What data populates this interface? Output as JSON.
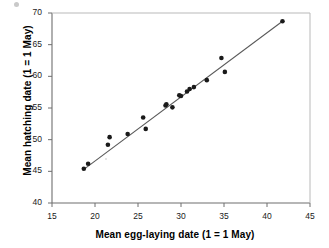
{
  "chart_data": {
    "type": "scatter",
    "title": "",
    "xlabel": "Mean egg-laying date (1 = 1 May)",
    "ylabel": "Mean hatching date (1 = 1 May)",
    "xlim": [
      15,
      45
    ],
    "ylim": [
      40,
      70
    ],
    "xticks": [
      15,
      20,
      25,
      30,
      35,
      40,
      45
    ],
    "yticks": [
      40,
      45,
      50,
      55,
      60,
      65,
      70
    ],
    "xtick_labels": [
      "15",
      "20",
      "25",
      "30",
      "35",
      "40",
      "45"
    ],
    "ytick_labels": [
      "40",
      "45",
      "50",
      "55",
      "60",
      "65",
      "70"
    ],
    "grid": false,
    "legend": null,
    "marker": {
      "shape": "circle",
      "color": "#1a1a1a",
      "size": 4.6
    },
    "series": [
      {
        "name": "Mean hatching date vs mean egg-laying date",
        "points": [
          {
            "x": 18.7,
            "y": 45.4
          },
          {
            "x": 19.2,
            "y": 46.2
          },
          {
            "x": 21.5,
            "y": 49.2
          },
          {
            "x": 21.7,
            "y": 50.4
          },
          {
            "x": 23.8,
            "y": 50.9
          },
          {
            "x": 25.6,
            "y": 53.5
          },
          {
            "x": 25.9,
            "y": 51.7
          },
          {
            "x": 28.2,
            "y": 55.4
          },
          {
            "x": 28.3,
            "y": 55.6
          },
          {
            "x": 29.0,
            "y": 55.1
          },
          {
            "x": 29.8,
            "y": 57.0
          },
          {
            "x": 30.0,
            "y": 56.9
          },
          {
            "x": 30.7,
            "y": 57.6
          },
          {
            "x": 31.0,
            "y": 58.0
          },
          {
            "x": 31.5,
            "y": 58.3
          },
          {
            "x": 33.0,
            "y": 59.4
          },
          {
            "x": 34.7,
            "y": 62.9
          },
          {
            "x": 35.1,
            "y": 60.7
          },
          {
            "x": 41.8,
            "y": 68.7
          }
        ]
      }
    ],
    "trendline": {
      "type": "linear-fit",
      "color": "#5a5a5a",
      "x_start": 18.7,
      "y_start": 45.3,
      "x_end": 41.8,
      "y_end": 68.7
    }
  }
}
